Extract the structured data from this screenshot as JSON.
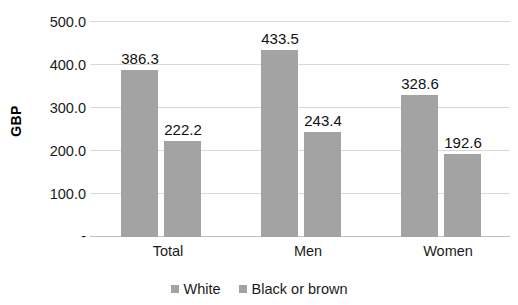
{
  "chart_data": {
    "type": "bar",
    "title": "",
    "xlabel": "",
    "ylabel": "GBP",
    "categories": [
      "Total",
      "Men",
      "Women"
    ],
    "series": [
      {
        "name": "White",
        "values": [
          386.3,
          433.5,
          328.6
        ],
        "color": "#a3a3a3"
      },
      {
        "name": "Black or brown",
        "values": [
          222.2,
          243.4,
          192.6
        ],
        "color": "#a3a3a3"
      }
    ],
    "ylim": [
      0,
      500
    ],
    "ytick_values": [
      0,
      100,
      200,
      300,
      400,
      500
    ],
    "ytick_labels": [
      "-",
      "100.0",
      "200.0",
      "300.0",
      "400.0",
      "500.0"
    ],
    "grid": true,
    "legend_position": "bottom",
    "data_labels": [
      "386.3",
      "222.2",
      "433.5",
      "243.4",
      "328.6",
      "192.6"
    ],
    "data_labels_shown": true
  },
  "axis": {
    "y_title": "GBP"
  },
  "legend": {
    "items": [
      {
        "label": "White"
      },
      {
        "label": "Black or brown"
      }
    ]
  },
  "colors": {
    "bar_fill": "#a3a3a3",
    "gridline": "#d9d9d9",
    "axis_line": "#bfbfbf",
    "text": "#1a1a1a"
  }
}
